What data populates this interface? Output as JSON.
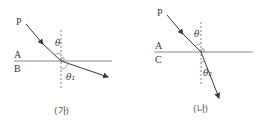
{
  "diagrams": [
    {
      "caption": "(가)",
      "point_label": "P",
      "upper_medium": "A",
      "lower_medium": "B",
      "incident_angle": "θ",
      "refracted_angle": "θ₁",
      "description": "Ray from P in medium A refracts into medium B, bending away from the normal"
    },
    {
      "caption": "(나)",
      "point_label": "P",
      "upper_medium": "A",
      "lower_medium": "C",
      "incident_angle": "θ",
      "refracted_angle": "θ₂",
      "description": "Ray from P in medium A refracts into medium C, bending toward the normal"
    }
  ],
  "colors": {
    "line": "#666666",
    "ray": "#3a3a3a",
    "boundary": "#8a8a8a"
  }
}
